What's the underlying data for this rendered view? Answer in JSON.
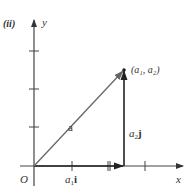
{
  "panel_label": "(ii)",
  "axes": {
    "x_label": "x",
    "y_label": "y",
    "origin_label": "O"
  },
  "vectors": {
    "a": {
      "label": "a"
    },
    "a1i": {
      "label_base": "a",
      "label_sub": "1",
      "label_vec": "i"
    },
    "a2j": {
      "label_base": "a",
      "label_sub": "2",
      "label_vec": "j"
    }
  },
  "point": {
    "label": "(a₁, a₂)"
  },
  "colors": {
    "axis": "#444444",
    "vector_a": "#666666",
    "vector_components": "#222222"
  }
}
